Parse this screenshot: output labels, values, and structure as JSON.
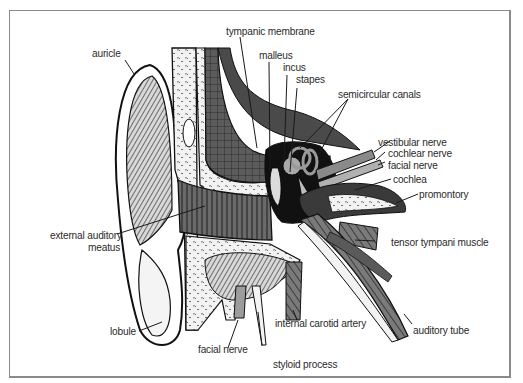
{
  "diagram": {
    "labels": {
      "auricle": "auricle",
      "tympanic_membrane": "tympanic membrane",
      "malleus": "malleus",
      "incus": "incus",
      "stapes": "stapes",
      "semicircular_canals": "semicircular canals",
      "vestibular_nerve": "vestibular nerve",
      "cochlear_nerve": "cochlear nerve",
      "facial_nerve_upper": "facial nerve",
      "cochlea": "cochlea",
      "promontory": "promontory",
      "external_auditory_meatus_1": "external auditory",
      "external_auditory_meatus_2": "meatus",
      "tensor_tympani_muscle": "tensor tympani muscle",
      "lobule": "lobule",
      "facial_nerve_lower": "facial nerve",
      "internal_carotid_artery": "internal carotid artery",
      "styloid_process": "styloid process",
      "auditory_tube": "auditory tube"
    }
  }
}
